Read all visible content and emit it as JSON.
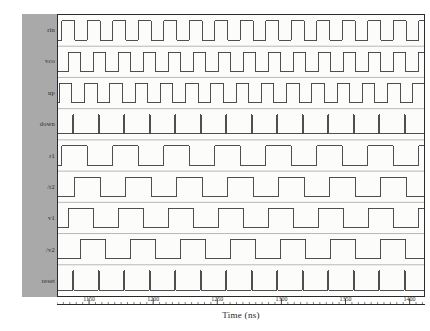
{
  "chart_data": {
    "type": "line",
    "title": "",
    "xlabel": "Time (ns)",
    "ylabel": "",
    "xlim": [
      1125,
      1412
    ],
    "grid": false,
    "legend_position": "left-gutter",
    "x_ticks": [
      1150,
      1200,
      1250,
      1300,
      1350,
      1400
    ],
    "x_tick_labels": [
      "1150",
      "1200",
      "1250",
      "1300",
      "1350",
      "1400"
    ],
    "minor_tick_interval": 5,
    "series": [
      {
        "name": "rin",
        "type": "digital",
        "period_ns": 20.0,
        "duty": 0.5,
        "phase_ns": 3.0,
        "transitions_ns": [
          1128,
          1138,
          1148,
          1158,
          1168,
          1178,
          1188,
          1198,
          1208,
          1218,
          1228,
          1238,
          1248,
          1258,
          1268,
          1278,
          1288,
          1298,
          1308,
          1318,
          1328,
          1338,
          1348,
          1358,
          1368,
          1378,
          1388,
          1398,
          1408
        ]
      },
      {
        "name": "vco",
        "type": "digital",
        "period_ns": 19.6,
        "duty": 0.5,
        "phase_ns": 8.0,
        "transitions_ns": [
          1133,
          1142.8,
          1152.6,
          1162.4,
          1172.2,
          1182,
          1191.8,
          1201.6,
          1211.4,
          1221.2,
          1231,
          1240.8,
          1250.6,
          1260.4,
          1270.2,
          1280,
          1289.8,
          1299.6,
          1309.4,
          1319.2,
          1329,
          1338.8,
          1348.6,
          1358.4,
          1368.2,
          1378,
          1387.8,
          1397.6,
          1407.4
        ]
      },
      {
        "name": "up",
        "type": "digital",
        "period_ns": 19.8,
        "duty": 0.5,
        "phase_ns": 0.0,
        "transitions_ns": [
          1126,
          1135.9,
          1145.8,
          1155.7,
          1165.6,
          1175.5,
          1185.4,
          1195.3,
          1205.2,
          1215.1,
          1225,
          1234.9,
          1244.8,
          1254.7,
          1264.6,
          1274.5,
          1284.4,
          1294.3,
          1304.2,
          1314.1,
          1324,
          1333.9,
          1343.8,
          1353.7,
          1363.6,
          1373.5,
          1383.4,
          1393.3,
          1403.2
        ]
      },
      {
        "name": "down",
        "type": "digital-pulse",
        "period_ns": 20.0,
        "pulse_width_ns": 0.7,
        "phase_ns": 12.0,
        "pulse_centers_ns": [
          1137,
          1157,
          1177,
          1197,
          1217,
          1237,
          1257,
          1277,
          1297,
          1317,
          1337,
          1357,
          1377,
          1397
        ]
      },
      {
        "name": "r1",
        "type": "digital",
        "period_ns": 40.0,
        "duty": 0.5,
        "phase_ns": 3.0,
        "transitions_ns": [
          1128,
          1148,
          1168,
          1188,
          1208,
          1228,
          1248,
          1268,
          1288,
          1308,
          1328,
          1348,
          1368,
          1388,
          1408
        ]
      },
      {
        "name": "/r2",
        "type": "digital",
        "period_ns": 40.0,
        "duty": 0.5,
        "phase_ns": 13.0,
        "transitions_ns": [
          1138,
          1158,
          1178,
          1198,
          1218,
          1238,
          1258,
          1278,
          1298,
          1318,
          1338,
          1358,
          1378,
          1398
        ]
      },
      {
        "name": "v1",
        "type": "digital",
        "period_ns": 39.2,
        "duty": 0.5,
        "phase_ns": 8.0,
        "transitions_ns": [
          1133,
          1152.6,
          1172.2,
          1191.8,
          1211.4,
          1231,
          1250.6,
          1270.2,
          1289.8,
          1309.4,
          1329,
          1348.6,
          1368.2,
          1387.8,
          1407.4
        ]
      },
      {
        "name": "/v2",
        "type": "digital",
        "period_ns": 39.2,
        "duty": 0.5,
        "phase_ns": 27.6,
        "transitions_ns": [
          1142.8,
          1162.4,
          1182,
          1201.6,
          1221.2,
          1240.8,
          1260.4,
          1280,
          1299.6,
          1319.2,
          1338.8,
          1358.4,
          1378,
          1397.6
        ]
      },
      {
        "name": "reset",
        "type": "digital-pulse",
        "period_ns": 20.0,
        "pulse_width_ns": 0.6,
        "phase_ns": 12.0,
        "pulse_centers_ns": [
          1137,
          1157,
          1177,
          1197,
          1217,
          1237,
          1257,
          1277,
          1297,
          1317,
          1337,
          1357,
          1377,
          1397
        ]
      }
    ]
  },
  "signals": {
    "labels": [
      "rin",
      "vco",
      "up",
      "down",
      "r1",
      "/r2",
      "v1",
      "/v2",
      "reset"
    ]
  },
  "axis": {
    "title": "Time (ns)",
    "tick_labels": [
      "1150",
      "1200",
      "1250",
      "1300",
      "1350",
      "1400"
    ]
  },
  "colors": {
    "gutter": "#a9a9a9",
    "plot_background": "#fcfcfa",
    "trace": "#3a3a3a",
    "frame": "#2b2b2b",
    "text": "#1c1c1c"
  }
}
